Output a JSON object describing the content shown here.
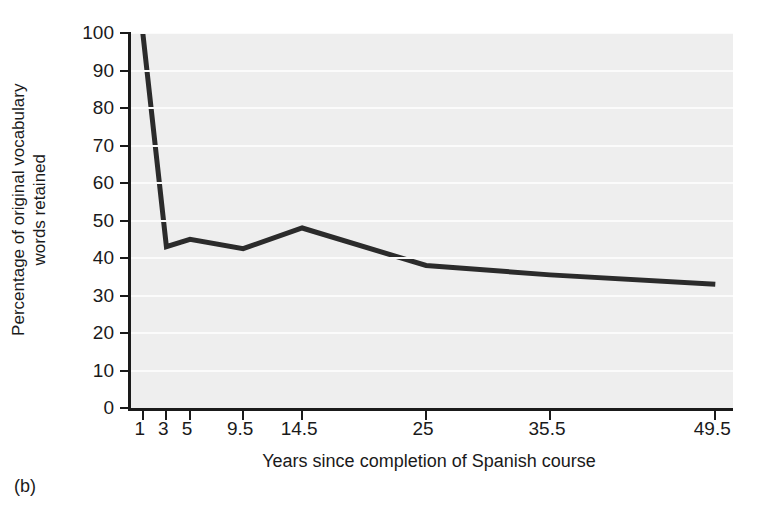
{
  "caption": "(b)",
  "chart_data": {
    "type": "line",
    "title": "",
    "xlabel": "Years since completion of Spanish course",
    "ylabel": "Percentage of original vocabulary words retained",
    "ylabel_lines": [
      "Percentage of original vocabulary",
      "words retained"
    ],
    "x": [
      1,
      3,
      5,
      9.5,
      14.5,
      25,
      35.5,
      49.5
    ],
    "xticklabels": [
      "1",
      "3",
      "5",
      "9.5",
      "14.5",
      "25",
      "35.5",
      "49.5"
    ],
    "values": [
      100,
      43,
      45,
      42.5,
      48,
      38,
      35.5,
      33
    ],
    "yticks": [
      0,
      10,
      20,
      30,
      40,
      50,
      60,
      70,
      80,
      90,
      100
    ],
    "yticklabels": [
      "0",
      "10",
      "20",
      "30",
      "40",
      "50",
      "60",
      "70",
      "80",
      "90",
      "100"
    ],
    "xlim": [
      0,
      51
    ],
    "ylim": [
      0,
      100
    ],
    "grid": true,
    "legend": false,
    "line_color": "#2b2b2b",
    "plot_bg": "#eeeeee",
    "grid_color": "#fbfbfb",
    "axis_color": "#1a1a1a"
  }
}
